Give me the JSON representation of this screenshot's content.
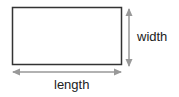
{
  "diagram": {
    "labels": {
      "width": "width",
      "length": "length"
    },
    "colors": {
      "rectangle_stroke": "#333333",
      "arrow": "#999999",
      "text": "#222222"
    }
  }
}
